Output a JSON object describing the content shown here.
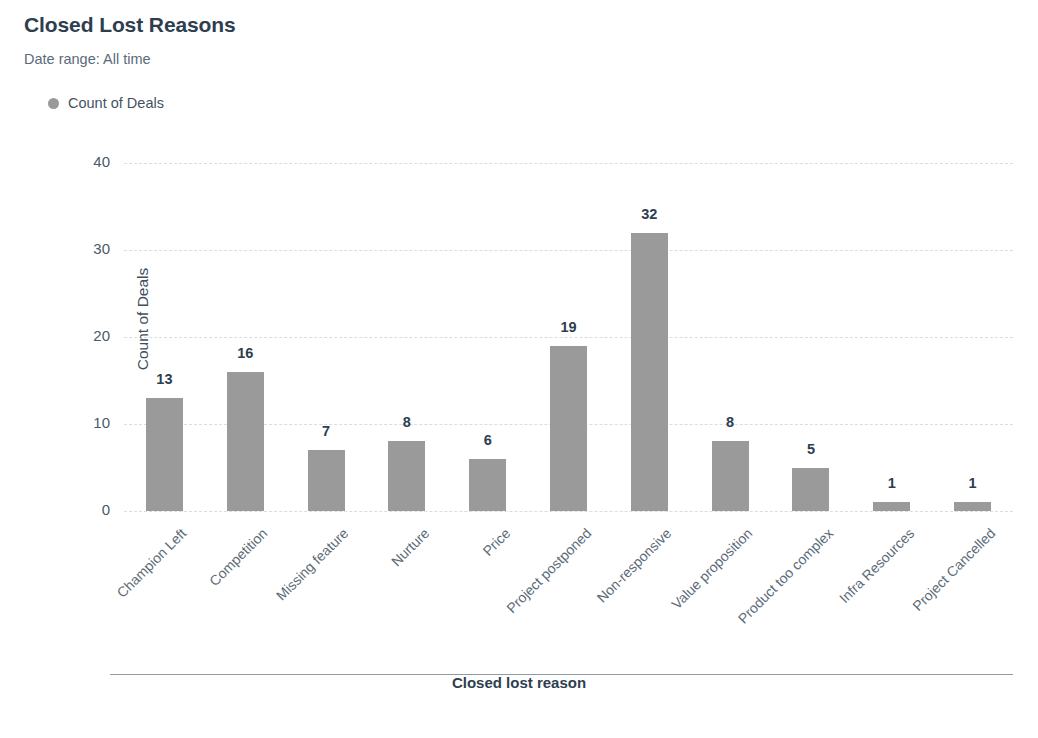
{
  "header": {
    "title": "Closed Lost Reasons",
    "subtitle": "Date range: All time"
  },
  "legend": {
    "position": "top-left",
    "marker_icon": "legend-dot-icon",
    "entries": [
      {
        "label": "Count of Deals",
        "color": "#9a9a9a"
      }
    ]
  },
  "chart_data": {
    "type": "bar",
    "title": "Closed Lost Reasons",
    "subtitle": "Date range: All time",
    "xlabel": "Closed lost reason",
    "ylabel": "Count of Deals",
    "ylim": [
      0,
      40
    ],
    "yticks": [
      0,
      10,
      20,
      30,
      40
    ],
    "grid": true,
    "legend": [
      "Count of Deals"
    ],
    "bar_color": "#9a9a9a",
    "categories": [
      "Champion Left",
      "Competition",
      "Missing feature",
      "Nurture",
      "Price",
      "Project postponed",
      "Non-responsive",
      "Value proposition",
      "Product too complex",
      "Infra Resources",
      "Project Cancelled"
    ],
    "series": [
      {
        "name": "Count of Deals",
        "values": [
          13,
          16,
          7,
          8,
          6,
          19,
          32,
          8,
          5,
          1,
          1
        ]
      }
    ]
  }
}
